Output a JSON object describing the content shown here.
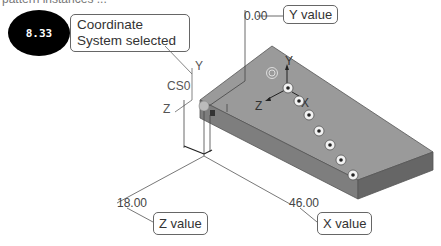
{
  "caption_top": "pattern instances ...",
  "step_badge": "8.33",
  "callouts": {
    "coordinate_system": "Coordinate\nSystem selected",
    "y_value": "Y value",
    "z_value": "Z value",
    "x_value": "X value"
  },
  "dimensions": {
    "y": "0.00",
    "z": "18.00",
    "x": "46.00"
  },
  "labels": {
    "cs_name": "CS0",
    "cs_axis_y": "Y",
    "cs_axis_z": "Z",
    "pattern_axis_y": "Y",
    "pattern_axis_z": "Z",
    "pattern_axis_x": "X"
  },
  "colors": {
    "top_face": "#9a9a9a",
    "front_face": "#7c7c7c",
    "side_face": "#6a6a6a",
    "badge_bg": "#000000",
    "leader": "#555555"
  },
  "holes": [
    {
      "x": 288,
      "y": 88
    },
    {
      "x": 299,
      "y": 101
    },
    {
      "x": 309,
      "y": 115
    },
    {
      "x": 319,
      "y": 131
    },
    {
      "x": 330,
      "y": 145
    },
    {
      "x": 341,
      "y": 160
    },
    {
      "x": 353,
      "y": 175
    }
  ]
}
